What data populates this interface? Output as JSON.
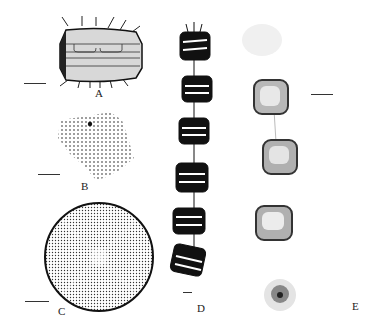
{
  "figure": {
    "panels": [
      {
        "id": "A",
        "label": "A",
        "description": "Frustule in girdle view with marginal spines"
      },
      {
        "id": "B",
        "label": "B",
        "description": "Valve fragment showing areolae pattern"
      },
      {
        "id": "C",
        "label": "C",
        "description": "Valve view, circular with radial areolae and marginal spines"
      },
      {
        "id": "D",
        "label": "D",
        "description": "Chain of six cells in girdle view"
      },
      {
        "id": "E",
        "label": "E",
        "description": "Light micrograph of chain of cells"
      }
    ],
    "scale_bars": [
      "A",
      "B",
      "C",
      "D",
      "E"
    ]
  }
}
